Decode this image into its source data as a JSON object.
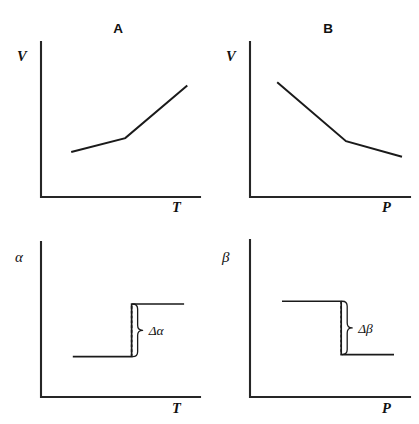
{
  "figure": {
    "width": 419,
    "height": 424,
    "background_color": "#ffffff",
    "line_color": "#1a1a1a",
    "axis_color": "#262626"
  },
  "panels": [
    {
      "id": "panel-a",
      "title": "A",
      "ylabel": "V",
      "xlabel": "T",
      "curve_kind": "piecewise-line",
      "description": "Volume increases with temperature; slope increases after the transition kink"
    },
    {
      "id": "panel-b",
      "title": "B",
      "ylabel": "V",
      "xlabel": "P",
      "curve_kind": "piecewise-line",
      "description": "Volume decreases with pressure; slope becomes shallower after the transition kink"
    },
    {
      "id": "panel-c",
      "title": "",
      "ylabel": "α",
      "xlabel": "T",
      "curve_kind": "step-up",
      "delta_label": "Δα",
      "description": "Thermal expansion coefficient jumps up discontinuously at the transition"
    },
    {
      "id": "panel-d",
      "title": "",
      "ylabel": "β",
      "xlabel": "P",
      "curve_kind": "step-down",
      "delta_label": "Δβ",
      "description": "Compressibility drops discontinuously at the transition"
    }
  ],
  "chart_data": [
    {
      "type": "line",
      "panel": "A",
      "title": "A",
      "xlabel": "T",
      "ylabel": "V",
      "xlim": [
        0,
        1
      ],
      "ylim": [
        0,
        1
      ],
      "grid": false,
      "legend": "none",
      "tick_labels": {
        "x": [],
        "y": []
      },
      "series": [
        {
          "name": "V(T)",
          "x": [
            0.19,
            0.53,
            0.92
          ],
          "y": [
            0.29,
            0.38,
            0.72
          ]
        }
      ],
      "annotations": []
    },
    {
      "type": "line",
      "panel": "B",
      "title": "B",
      "xlabel": "P",
      "ylabel": "V",
      "xlim": [
        0,
        1
      ],
      "ylim": [
        0,
        1
      ],
      "grid": false,
      "legend": "none",
      "tick_labels": {
        "x": [],
        "y": []
      },
      "series": [
        {
          "name": "V(P)",
          "x": [
            0.17,
            0.6,
            0.95
          ],
          "y": [
            0.74,
            0.36,
            0.26
          ]
        }
      ],
      "annotations": []
    },
    {
      "type": "line",
      "panel": "C",
      "title": "",
      "xlabel": "T",
      "ylabel": "α",
      "xlim": [
        0,
        1
      ],
      "ylim": [
        0,
        1
      ],
      "grid": false,
      "legend": "none",
      "tick_labels": {
        "x": [],
        "y": []
      },
      "series": [
        {
          "name": "α(T)",
          "x": [
            0.2,
            0.57,
            0.57,
            0.9
          ],
          "y": [
            0.26,
            0.26,
            0.6,
            0.6
          ]
        }
      ],
      "annotations": [
        {
          "text": "Δα",
          "x": 0.57,
          "y_from": 0.26,
          "y_to": 0.6,
          "style": "brace"
        }
      ]
    },
    {
      "type": "line",
      "panel": "D",
      "title": "",
      "xlabel": "P",
      "ylabel": "β",
      "xlim": [
        0,
        1
      ],
      "ylim": [
        0,
        1
      ],
      "grid": false,
      "legend": "none",
      "tick_labels": {
        "x": [],
        "y": []
      },
      "series": [
        {
          "name": "β(P)",
          "x": [
            0.2,
            0.57,
            0.57,
            0.9
          ],
          "y": [
            0.61,
            0.61,
            0.27,
            0.27
          ]
        }
      ],
      "annotations": [
        {
          "text": "Δβ",
          "x": 0.57,
          "y_from": 0.61,
          "y_to": 0.27,
          "style": "brace"
        }
      ]
    }
  ]
}
